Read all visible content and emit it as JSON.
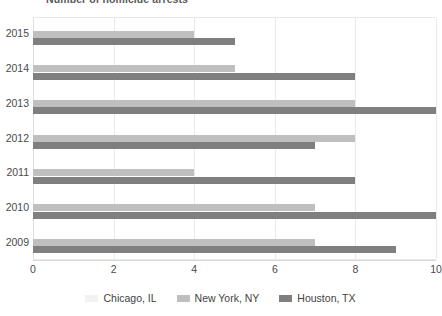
{
  "chart_data": {
    "type": "bar",
    "orientation": "horizontal",
    "title": "Number of homicide arrests",
    "categories": [
      "2015",
      "2014",
      "2013",
      "2012",
      "2011",
      "2010",
      "2009"
    ],
    "series": [
      {
        "name": "Chicago, IL",
        "color": "#f2f2f2",
        "values": [
          0,
          0,
          0,
          0,
          0,
          0,
          0
        ]
      },
      {
        "name": "New York, NY",
        "color": "#bfbfbf",
        "values": [
          4,
          5,
          8,
          8,
          4,
          7,
          7
        ]
      },
      {
        "name": "Houston, TX",
        "color": "#7f7f7f",
        "values": [
          5,
          8,
          10,
          7,
          8,
          10,
          9
        ]
      }
    ],
    "xlabel": "",
    "ylabel": "",
    "xlim": [
      0,
      10
    ],
    "xticks": [
      "0",
      "2",
      "4",
      "6",
      "8",
      "10"
    ],
    "xtick_values": [
      0,
      2,
      4,
      6,
      8,
      10
    ],
    "grid": true,
    "legend_position": "bottom"
  },
  "legend": {
    "items": [
      {
        "label": "Chicago, IL",
        "color": "#f2f2f2"
      },
      {
        "label": "New York, NY",
        "color": "#bfbfbf"
      },
      {
        "label": "Houston, TX",
        "color": "#7f7f7f"
      }
    ]
  }
}
